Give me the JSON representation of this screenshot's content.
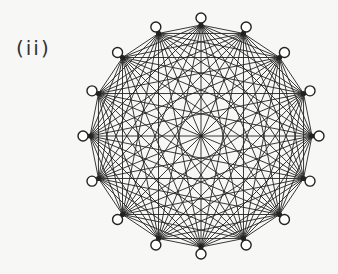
{
  "figure": {
    "label": "(ii)",
    "graph": {
      "type": "complete-graph",
      "vertex_count": 16,
      "center": [
        201,
        136
      ],
      "hub_radius": 111,
      "node_radius_outer": 118,
      "start_angle_deg": -90,
      "edge_color": "#222222",
      "node_fill": "#ffffff",
      "node_stroke": "#222222"
    }
  }
}
